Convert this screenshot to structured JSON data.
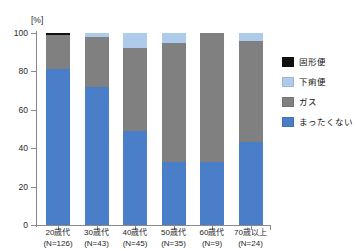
{
  "top_caption": "",
  "chart_data": {
    "type": "bar",
    "subtype": "stacked-bar-100",
    "title": "",
    "xlabel": "",
    "ylabel": "[%]",
    "unit_label": "[%]",
    "ylim": [
      0,
      100
    ],
    "yticks": [
      0,
      20,
      40,
      60,
      80,
      100
    ],
    "ytick_labels": [
      "0",
      "20",
      "40",
      "60",
      "80",
      "100"
    ],
    "grid": false,
    "legend_position": "right",
    "categories": [
      "20歳代",
      "30歳代",
      "40歳代",
      "50歳代",
      "60歳代",
      "70歳以上"
    ],
    "category_sublabels": [
      "(N=126)",
      "(N=43)",
      "(N=45)",
      "(N=35)",
      "(N=9)",
      "(N=24)"
    ],
    "series": [
      {
        "name": "まったくない",
        "color": "#4a7ec8",
        "values": [
          81,
          72,
          49,
          33,
          33,
          43
        ]
      },
      {
        "name": "ガス",
        "color": "#808080",
        "values": [
          18,
          26,
          43,
          62,
          67,
          53
        ]
      },
      {
        "name": "下痢便",
        "color": "#aecbec",
        "values": [
          0,
          2,
          8,
          5,
          0,
          4
        ]
      },
      {
        "name": "固形便",
        "color": "#111111",
        "values": [
          1,
          0,
          0,
          0,
          0,
          0
        ]
      }
    ],
    "legend": [
      {
        "label": "固形便",
        "color": "#111111"
      },
      {
        "label": "下痢便",
        "color": "#aecbec"
      },
      {
        "label": "ガス",
        "color": "#808080"
      },
      {
        "label": "まったくない",
        "color": "#4a7ec8"
      }
    ],
    "axis_color": "#8a8a8a",
    "background": "#ffffff"
  }
}
